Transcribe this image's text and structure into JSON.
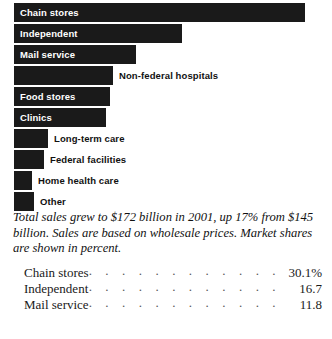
{
  "chart_data": {
    "type": "bar",
    "title": "",
    "xlabel": "",
    "ylabel": "",
    "orientation": "horizontal",
    "grid": false,
    "legend": "none",
    "units": "percent market share",
    "categories": [
      "Chain stores",
      "Independent",
      "Mail service",
      "Non-federal hospitals",
      "Food stores",
      "Clinics",
      "Long-term care",
      "Federal facilities",
      "Home health care",
      "Other"
    ],
    "values": [
      30.1,
      16.7,
      11.8,
      10.2,
      9.9,
      9.4,
      3.5,
      3.1,
      1.9,
      2.0
    ],
    "xlim": [
      0,
      30.1
    ],
    "bar_color": "#1a1a1a"
  },
  "bars": [
    {
      "label": "Chain stores",
      "width_px": 291,
      "label_position": "inside"
    },
    {
      "label": "Independent",
      "width_px": 168,
      "label_position": "inside"
    },
    {
      "label": "Mail service",
      "width_px": 122,
      "label_position": "inside"
    },
    {
      "label": "Non-federal hospitals",
      "width_px": 99,
      "label_position": "outside"
    },
    {
      "label": "Food stores",
      "width_px": 96,
      "label_position": "inside"
    },
    {
      "label": "Clinics",
      "width_px": 92,
      "label_position": "inside"
    },
    {
      "label": "Long-term care",
      "width_px": 34,
      "label_position": "outside"
    },
    {
      "label": "Federal facilities",
      "width_px": 30,
      "label_position": "outside"
    },
    {
      "label": "Home health care",
      "width_px": 18,
      "label_position": "outside"
    },
    {
      "label": "Other",
      "width_px": 20,
      "label_position": "outside"
    }
  ],
  "caption": "Total sales grew to $172 billion in 2001, up 17% from $145 billion. Sales are based on wholesale prices. Market shares are shown in percent.",
  "table": {
    "rows": [
      {
        "name": "Chain stores",
        "value": "30.1%"
      },
      {
        "name": "Independent",
        "value": "16.7"
      },
      {
        "name": "Mail service",
        "value": "11.8"
      }
    ],
    "leader": ". . . . . . . . . . . . . . . . . . . . . . . . . . . . . . . . . . . ."
  }
}
